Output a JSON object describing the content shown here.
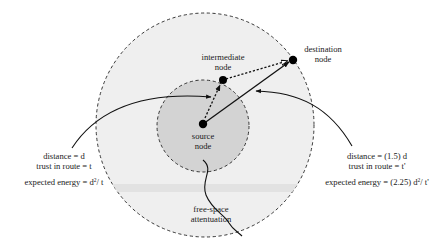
{
  "diagram": {
    "nodes": {
      "source": {
        "line1": "source",
        "line2": "node"
      },
      "intermediate": {
        "line1": "intermediate",
        "line2": "node"
      },
      "destination": {
        "line1": "destination",
        "line2": "node"
      }
    },
    "left_annotation": {
      "distance": "distance = d",
      "trust": "trust in route = t",
      "energy_prefix": "expected energy = d",
      "energy_exp": "2",
      "energy_suffix": "/ t"
    },
    "right_annotation": {
      "distance": "distance = (1.5) d",
      "trust": "trust in route = t'",
      "energy_prefix": "expected energy = (2.25) d",
      "energy_exp": "2",
      "energy_suffix": "/ t'"
    },
    "attenuation": {
      "line1": "free-space",
      "line2": "attentuation"
    },
    "colors": {
      "outer_fill": "#efefef",
      "inner_fill": "#d3d3d3",
      "stroke": "#111111",
      "band": "#e2e2e2"
    }
  }
}
